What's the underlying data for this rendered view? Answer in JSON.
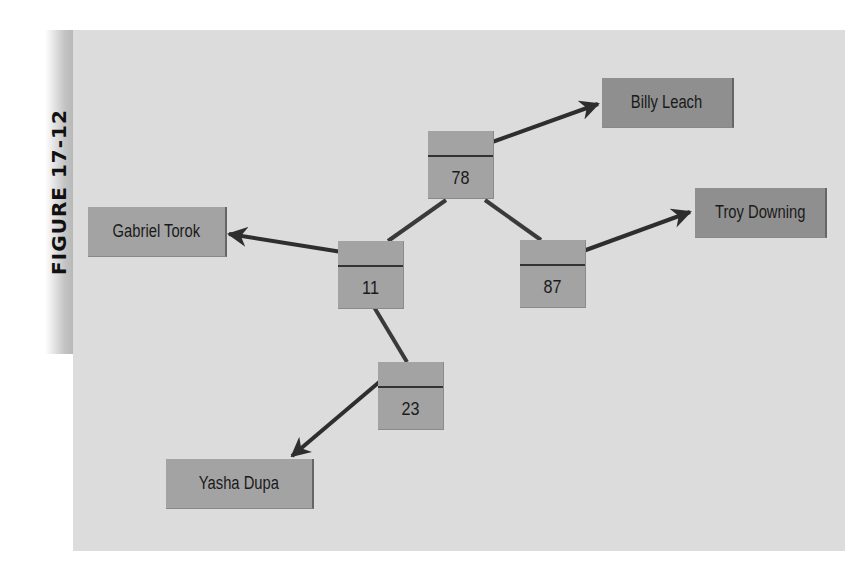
{
  "figure": {
    "label": "FIGURE 17-12"
  },
  "colors": {
    "panel_background": "#dcdcdc",
    "node_fill": "#a3a3a3",
    "label_fill": "#a3a3a3",
    "label_fill_dark": "#8f8f8f",
    "line": "#3a3a3a"
  },
  "tree": {
    "nodes": [
      {
        "id": "n78",
        "key": "78",
        "role": "root"
      },
      {
        "id": "n11",
        "key": "11",
        "role": "left child of 78"
      },
      {
        "id": "n87",
        "key": "87",
        "role": "right child of 78"
      },
      {
        "id": "n23",
        "key": "23",
        "role": "right child of 11"
      }
    ],
    "labels": [
      {
        "id": "billy",
        "text": "Billy Leach",
        "points_from": "78"
      },
      {
        "id": "troy",
        "text": "Troy Downing",
        "points_from": "87"
      },
      {
        "id": "gabriel",
        "text": "Gabriel Torok",
        "points_from": "11"
      },
      {
        "id": "yasha",
        "text": "Yasha Dupa",
        "points_from": "23"
      }
    ],
    "edges": [
      {
        "from": "78",
        "to": "11"
      },
      {
        "from": "78",
        "to": "87"
      },
      {
        "from": "11",
        "to": "23"
      }
    ]
  }
}
